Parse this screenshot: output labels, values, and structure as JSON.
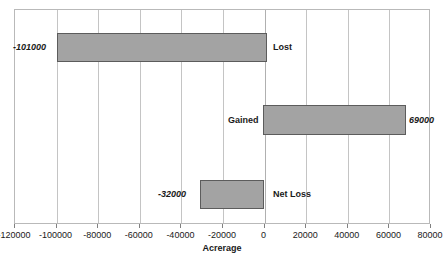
{
  "chart_data": {
    "type": "bar",
    "orientation": "horizontal",
    "title": "",
    "xlabel": "Acrerage",
    "ylabel": "",
    "xlim": [
      -120000,
      80000
    ],
    "xticks": [
      -120000,
      -100000,
      -80000,
      -60000,
      -40000,
      -20000,
      0,
      20000,
      40000,
      60000,
      80000
    ],
    "xtick_labels": [
      "-120000",
      "-100000",
      "-80000",
      "-60000",
      "-40000",
      "-20000",
      "0",
      "20000",
      "40000",
      "60000",
      "80000"
    ],
    "grid": true,
    "legend": false,
    "categories": [
      "Lost",
      "Gained",
      "Net Loss"
    ],
    "values": [
      -101000,
      69000,
      -32000
    ],
    "value_labels": [
      "-101000",
      "69000",
      "-32000"
    ],
    "colors": {
      "bar_fill": "#a3a3a3",
      "bar_border": "#5c5c5c",
      "gridline": "#c4c4c4",
      "plot_border": "#b9b9b9",
      "text": "#1a1a1a",
      "background": "#ffffff"
    },
    "bars": [
      {
        "category": "Lost",
        "value": -101000,
        "value_label": "-101000",
        "left_px": 42,
        "width_px": 210,
        "top_px": 23,
        "height_px": 29,
        "value_label_x": -2,
        "value_label_y": 33,
        "cat_label_x": 258,
        "cat_label_y": 33
      },
      {
        "category": "Gained",
        "value": 69000,
        "value_label": "69000",
        "left_px": 248,
        "width_px": 143,
        "top_px": 95,
        "height_px": 30,
        "value_label_x": 394,
        "value_label_y": 106,
        "cat_label_x": 213,
        "cat_label_y": 106
      },
      {
        "category": "Net Loss",
        "value": -32000,
        "value_label": "-32000",
        "left_px": 185,
        "width_px": 64,
        "top_px": 170,
        "height_px": 29,
        "value_label_x": 143,
        "value_label_y": 180,
        "cat_label_x": 258,
        "cat_label_y": 180
      }
    ],
    "gridlines_px": [
      0,
      41.6,
      83.2,
      124.8,
      166.4,
      208,
      249.6,
      291.2,
      332.8,
      374.4,
      416
    ],
    "zero_index": 6
  }
}
